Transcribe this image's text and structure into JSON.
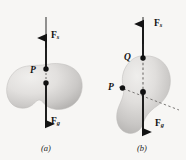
{
  "figure": {
    "background_color": "#f7f6f4",
    "ink_color": "#131313",
    "blob_fill_light": "#e9e8e6",
    "blob_fill_mid": "#cfcdcb",
    "blob_fill_dark": "#a9a7a5"
  },
  "panel_a": {
    "caption": "(a)",
    "spring_force_label": "F",
    "spring_force_subscript": "s",
    "gravity_force_label": "F",
    "gravity_force_subscript": "g",
    "suspension_point_label": "P",
    "ceiling": "hatched-ceiling-line",
    "string": "vertical-suspension-string",
    "body": "irregular-bean-shaped-body",
    "dashed_segment": "vertical-dashed-line-from-P-to-center-of-mass",
    "points": [
      "P",
      "center-of-mass"
    ]
  },
  "panel_b": {
    "caption": "(b)",
    "spring_force_label": "F",
    "spring_force_subscript": "s",
    "gravity_force_label": "F",
    "gravity_force_subscript": "g",
    "suspension_point_label": "Q",
    "other_point_label": "P",
    "ceiling": "hatched-ceiling-line",
    "string": "vertical-suspension-string",
    "body": "irregular-bean-shaped-body-rotated",
    "dashed_segment_vertical": "vertical-dashed-line-from-Q-to-center-of-mass",
    "dashed_segment_diagonal": "dashed-line-through-P-and-center-of-mass",
    "points": [
      "Q",
      "P",
      "center-of-mass"
    ]
  }
}
